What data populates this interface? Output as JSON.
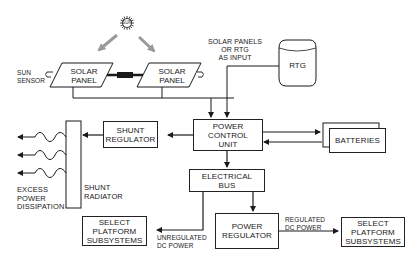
{
  "diagram": {
    "nodes": {
      "sun": {
        "label": "SUN"
      },
      "sun_sensor": {
        "label": "SUN\nSENSOR"
      },
      "solar_panel_left": {
        "label": "SOLAR\nPANEL"
      },
      "solar_panel_right": {
        "label": "SOLAR\nPANEL"
      },
      "input_note": {
        "label": "SOLAR PANELS\nOR RTG\nAS INPUT"
      },
      "rtg": {
        "label": "RTG"
      },
      "power_control_unit": {
        "label": "POWER\nCONTROL\nUNIT"
      },
      "shunt_regulator": {
        "label": "SHUNT\nREGULATOR"
      },
      "shunt_radiator": {
        "label": "SHUNT\nRADIATOR"
      },
      "excess_power": {
        "label": "EXCESS\nPOWER\nDISSIPATION"
      },
      "batteries": {
        "label": "BATTERIES"
      },
      "electrical_bus": {
        "label": "ELECTRICAL\nBUS"
      },
      "power_regulator": {
        "label": "POWER\nREGULATOR"
      },
      "select_platform_left": {
        "label": "SELECT\nPLATFORM\nSUBSYSTEMS"
      },
      "select_platform_right": {
        "label": "SELECT\nPLATFORM\nSUBSYSTEMS"
      }
    },
    "edge_labels": {
      "unregulated": "UNREGULATED\nDC POWER",
      "regulated": "REGULATED\nDC POWER"
    },
    "colors": {
      "line": "#1a1a1a",
      "sun_ray_arrow": "#9a9a9a",
      "background": "#ffffff"
    }
  }
}
